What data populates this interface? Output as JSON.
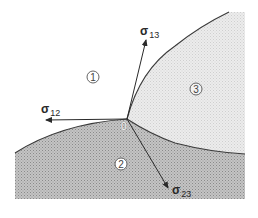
{
  "diagram": {
    "vertex": {
      "label": "0"
    },
    "regions": [
      {
        "id": "region-1",
        "label": "1",
        "fill": "#ffffff"
      },
      {
        "id": "region-2",
        "label": "2",
        "fill": "#b4b4b4"
      },
      {
        "id": "region-3",
        "label": "3",
        "fill": "#e4e4e4"
      }
    ],
    "vectors": [
      {
        "id": "sigma-12",
        "symbol": "σ",
        "subscript": "12"
      },
      {
        "id": "sigma-13",
        "symbol": "σ",
        "subscript": "13"
      },
      {
        "id": "sigma-23",
        "symbol": "σ",
        "subscript": "23"
      }
    ],
    "colors": {
      "boundary": "#3a3a3a",
      "arrow": "#2a2a2a",
      "region2_shade": "#b4b4b4",
      "region3_shade": "#e4e4e4"
    }
  }
}
